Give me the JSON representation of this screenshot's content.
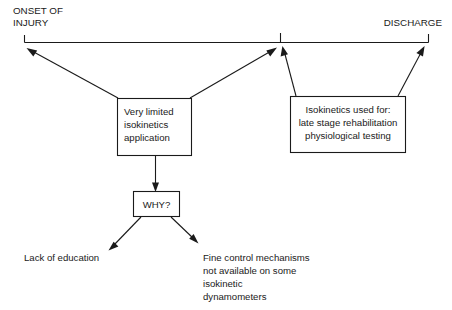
{
  "diagram": {
    "title_left": "ONSET OF",
    "title_left_line2": "INJURY",
    "title_right": "DISCHARGE",
    "timeline": {
      "start_label": "ONSET OF INJURY",
      "end_label": "DISCHARGE",
      "mid_tick_present": true
    },
    "boxes": [
      {
        "id": "very-limited",
        "lines": [
          "Very limited",
          "isokinetics",
          "application"
        ],
        "align": "left"
      },
      {
        "id": "isokinetics-used-for",
        "lines": [
          "Isokinetics used for:",
          "late stage rehabilitation",
          "physiological testing"
        ],
        "align": "center"
      },
      {
        "id": "why",
        "lines": [
          "WHY?"
        ],
        "align": "center"
      }
    ],
    "leaf_labels": [
      {
        "id": "lack-of-education",
        "lines": [
          "Lack of education"
        ]
      },
      {
        "id": "fine-control",
        "lines": [
          "Fine control mechanisms",
          "not available on some",
          "isokinetic",
          "dynamometers"
        ]
      }
    ],
    "colors": {
      "ink": "#1a1a1a",
      "background": "#ffffff"
    }
  }
}
